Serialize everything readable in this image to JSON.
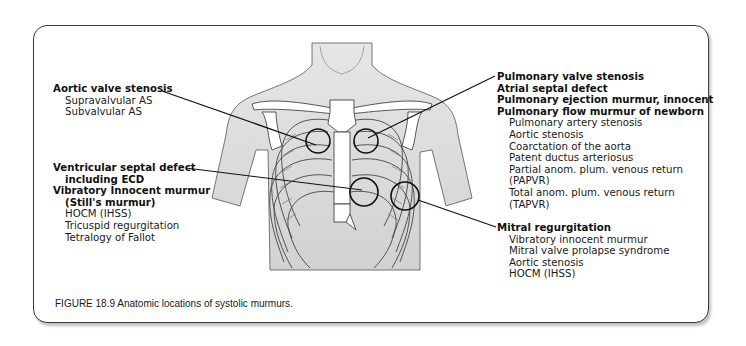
{
  "figure": {
    "caption": "FIGURE 18.9 Anatomic locations of systolic murmurs.",
    "illustration": "chest-rib-cage-torso",
    "colors": {
      "line": "#1a1a1a",
      "skin": "#d9d9d9",
      "bone": "#ffffff",
      "frame": "#3a3a3a"
    }
  },
  "callouts": {
    "aortic": {
      "heading": "Aortic valve stenosis",
      "items": [
        "Supravalvular AS",
        "Subvalvular AS"
      ]
    },
    "tricuspid": {
      "headings": [
        "Ventricular septal defect",
        "including ECD",
        "Vibratory Innocent murmur",
        "(Still's murmur)"
      ],
      "items": [
        "HOCM (IHSS)",
        "Tricuspid regurgitation",
        "Tetralogy of Fallot"
      ]
    },
    "pulmonic": {
      "headings": [
        "Pulmonary valve stenosis",
        "Atrial septal defect",
        "Pulmonary ejection murmur, innocent",
        "Pulmonary flow murmur of newborn"
      ],
      "items": [
        "Pulmonary artery stenosis",
        "Aortic stenosis",
        "Coarctation of the aorta",
        "Patent ductus arteriosus",
        "Partial anom. plum. venous return",
        "(PAPVR)",
        "Total anom. plum. venous return",
        "(TAPVR)"
      ]
    },
    "mitral": {
      "heading": "Mitral regurgitation",
      "items": [
        "Vibratory innocent murmur",
        "Mitral valve prolapse syndrome",
        "Aortic stenosis",
        "HOCM (IHSS)"
      ]
    }
  }
}
